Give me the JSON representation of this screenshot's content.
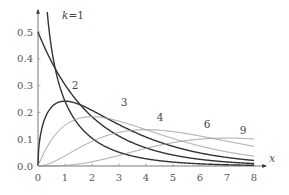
{
  "chart_data": {
    "type": "line",
    "title": "",
    "xlabel": "x",
    "ylabel": "",
    "xlim": [
      0,
      8
    ],
    "ylim": [
      0,
      0.5
    ],
    "grid": false,
    "legend": "none (inline curve labels)",
    "x_ticks": [
      "0",
      "1",
      "2",
      "3",
      "4",
      "5",
      "6",
      "7",
      "8"
    ],
    "y_ticks": [
      "0.0",
      "0.1",
      "0.2",
      "0.3",
      "0.4",
      "0.5"
    ],
    "series": [
      {
        "name": "k=1",
        "label": "k=1",
        "k": 1,
        "color": "#333333",
        "width": 1.4,
        "label_pos": [
          73,
          19
        ],
        "x": [
          0.1,
          0.25,
          0.5,
          1,
          1.5,
          2,
          3,
          4,
          5,
          6,
          7,
          8
        ],
        "values": [
          1.2,
          0.704,
          0.439,
          0.242,
          0.154,
          0.104,
          0.051,
          0.027,
          0.015,
          0.008,
          0.005,
          0.003
        ]
      },
      {
        "name": "k=2",
        "label": "2",
        "k": 2,
        "color": "#333333",
        "width": 1.4,
        "label_pos": [
          75,
          89
        ],
        "x": [
          0,
          0.5,
          1,
          1.5,
          2,
          3,
          4,
          5,
          6,
          7,
          8
        ],
        "values": [
          0.5,
          0.389,
          0.303,
          0.236,
          0.184,
          0.112,
          0.068,
          0.041,
          0.025,
          0.015,
          0.009
        ]
      },
      {
        "name": "k=3",
        "label": "3",
        "k": 3,
        "color": "#333333",
        "width": 1.4,
        "label_pos": [
          124,
          106
        ],
        "x": [
          0,
          0.5,
          1,
          1.5,
          2,
          3,
          4,
          5,
          6,
          7,
          8
        ],
        "values": [
          0.0,
          0.22,
          0.242,
          0.231,
          0.208,
          0.154,
          0.108,
          0.073,
          0.049,
          0.032,
          0.021
        ]
      },
      {
        "name": "k=4",
        "label": "4",
        "k": 4,
        "color": "#999999",
        "width": 1.0,
        "label_pos": [
          160,
          121
        ],
        "x": [
          0,
          0.5,
          1,
          1.5,
          2,
          3,
          4,
          5,
          6,
          7,
          8
        ],
        "values": [
          0.0,
          0.097,
          0.152,
          0.177,
          0.184,
          0.167,
          0.135,
          0.103,
          0.075,
          0.053,
          0.037
        ]
      },
      {
        "name": "k=6",
        "label": "6",
        "k": 6,
        "color": "#999999",
        "width": 1.0,
        "label_pos": [
          207,
          128
        ],
        "x": [
          0,
          1,
          2,
          3,
          4,
          5,
          6,
          7,
          8
        ],
        "values": [
          0.0,
          0.038,
          0.092,
          0.126,
          0.135,
          0.128,
          0.112,
          0.092,
          0.073
        ]
      },
      {
        "name": "k=9",
        "label": "9",
        "k": 9,
        "color": "#999999",
        "width": 1.0,
        "label_pos": [
          243,
          134
        ],
        "x": [
          0,
          1,
          2,
          3,
          4,
          5,
          6,
          7,
          8
        ],
        "values": [
          0.0,
          0.002,
          0.015,
          0.04,
          0.066,
          0.087,
          0.097,
          0.1,
          0.095
        ]
      }
    ]
  },
  "plot_area": {
    "origin_px": [
      38,
      166
    ],
    "px_per_x_unit": 27,
    "px_per_y_unit": 268,
    "x_axis_end_px": 266,
    "y_axis_top_px": 10
  }
}
